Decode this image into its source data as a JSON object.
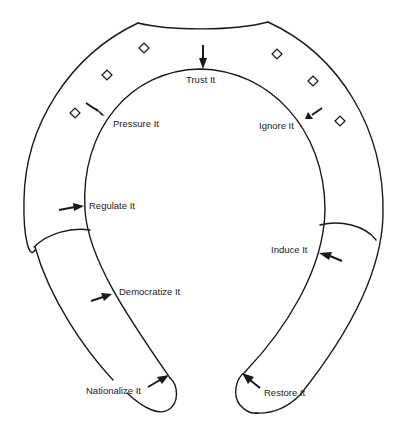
{
  "diagram": {
    "type": "horseshoe",
    "stroke_color": "#1a1a1a",
    "background_color": "#ffffff",
    "labels": [
      {
        "id": "trust",
        "text": "Trust It",
        "x": 186,
        "y": 78
      },
      {
        "id": "pressure",
        "text": "Pressure It",
        "x": 113,
        "y": 121
      },
      {
        "id": "ignore",
        "text": "Ignore It",
        "x": 259,
        "y": 122
      },
      {
        "id": "regulate",
        "text": "Regulate It",
        "x": 89,
        "y": 202
      },
      {
        "id": "induce",
        "text": "Induce It",
        "x": 271,
        "y": 246
      },
      {
        "id": "democratize",
        "text": "Democratize It",
        "x": 119,
        "y": 288
      },
      {
        "id": "nationalize",
        "text": "Nationalize It",
        "x": 86,
        "y": 386
      },
      {
        "id": "restore",
        "text": "Restore It",
        "x": 264,
        "y": 389
      }
    ],
    "diamond_count": 6
  }
}
